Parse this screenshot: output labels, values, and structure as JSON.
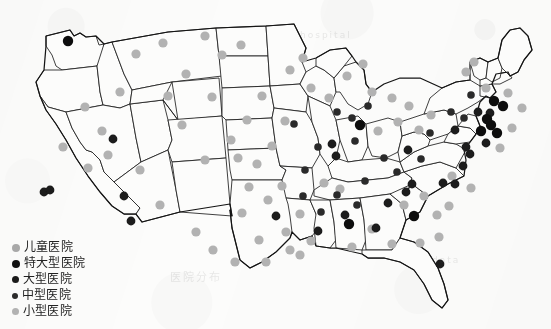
{
  "figure": {
    "kind": "choropleth-point-map",
    "region": "United States (contiguous)",
    "background_color": "#fcfcfb",
    "state_fill": "#fcfcfb",
    "state_stroke": "#1d1d1d"
  },
  "legend": {
    "position": "bottom-left",
    "items": [
      {
        "label": "儿童医院",
        "color": "#a8a8a8",
        "size": 8,
        "category": "childrens-hospital"
      },
      {
        "label": "特大型医院",
        "color": "#111111",
        "size": 8,
        "category": "extra-large-hospital"
      },
      {
        "label": "大型医院",
        "color": "#1a1a1a",
        "size": 7,
        "category": "large-hospital"
      },
      {
        "label": "中型医院",
        "color": "#2b2b2b",
        "size": 6,
        "category": "medium-hospital"
      },
      {
        "label": "小型医院",
        "color": "#b2b2b2",
        "size": 7,
        "category": "small-hospital"
      }
    ]
  },
  "ghost_marks": [
    {
      "text": "医院分布",
      "x": 170,
      "y": 268,
      "size": 11
    },
    {
      "text": "hospital",
      "x": 300,
      "y": 30,
      "size": 9
    },
    {
      "text": "data",
      "x": 432,
      "y": 255,
      "size": 9
    }
  ],
  "chart_data": {
    "type": "scatter",
    "title": "",
    "xlabel": "",
    "ylabel": "",
    "coordinate_space": "image-pixels",
    "categories": [
      "儿童医院",
      "特大型医院",
      "大型医院",
      "中型医院",
      "小型医院"
    ],
    "series": [
      {
        "name": "特大型医院",
        "color": "#111111",
        "r": 5.2,
        "points": [
          [
            68,
            41
          ],
          [
            494,
            101
          ],
          [
            503,
            106
          ],
          [
            487,
            119
          ],
          [
            491,
            125
          ],
          [
            481,
            131
          ],
          [
            497,
            133
          ],
          [
            360,
            125
          ],
          [
            414,
            216
          ],
          [
            349,
            224
          ]
        ]
      },
      {
        "name": "大型医院",
        "color": "#1a1a1a",
        "r": 4.4,
        "points": [
          [
            44,
            192
          ],
          [
            50,
            190
          ],
          [
            124,
            196
          ],
          [
            131,
            221
          ],
          [
            113,
            139
          ],
          [
            276,
            216
          ],
          [
            332,
            144
          ],
          [
            336,
            156
          ],
          [
            408,
            150
          ],
          [
            412,
            184
          ],
          [
            443,
            183
          ],
          [
            470,
            154
          ],
          [
            466,
            147
          ],
          [
            455,
            184
          ],
          [
            376,
            228
          ],
          [
            345,
            215
          ],
          [
            455,
            130
          ],
          [
            463,
            166
          ],
          [
            486,
            143
          ],
          [
            440,
            264
          ],
          [
            406,
            192
          ],
          [
            388,
            203
          ],
          [
            318,
            231
          ],
          [
            490,
            113
          ],
          [
            478,
            112
          ]
        ]
      },
      {
        "name": "中型医院",
        "color": "#2b2b2b",
        "r": 3.8,
        "points": [
          [
            355,
            141
          ],
          [
            318,
            147
          ],
          [
            305,
            170
          ],
          [
            365,
            181
          ],
          [
            384,
            158
          ],
          [
            421,
            159
          ],
          [
            430,
            133
          ],
          [
            451,
            112
          ],
          [
            471,
            95
          ],
          [
            464,
            118
          ],
          [
            337,
            195
          ],
          [
            303,
            196
          ],
          [
            357,
            205
          ],
          [
            321,
            212
          ],
          [
            397,
            172
          ],
          [
            352,
            118
          ],
          [
            368,
            106
          ],
          [
            337,
            112
          ],
          [
            294,
            124
          ]
        ]
      },
      {
        "name": "小型医院",
        "color": "#b2b2b2",
        "r": 4.6,
        "points": [
          [
            241,
            45
          ],
          [
            136,
            54
          ],
          [
            102,
            131
          ],
          [
            182,
            125
          ],
          [
            186,
            74
          ],
          [
            212,
            97
          ],
          [
            262,
            96
          ],
          [
            231,
            140
          ],
          [
            247,
            120
          ],
          [
            285,
            121
          ],
          [
            272,
            146
          ],
          [
            257,
            164
          ],
          [
            249,
            187
          ],
          [
            242,
            213
          ],
          [
            259,
            240
          ],
          [
            282,
            186
          ],
          [
            300,
            214
          ],
          [
            286,
            232
          ],
          [
            324,
            183
          ],
          [
            340,
            189
          ],
          [
            311,
            241
          ],
          [
            352,
            247
          ],
          [
            372,
            229
          ],
          [
            392,
            244
          ],
          [
            404,
            205
          ],
          [
            424,
            196
          ],
          [
            437,
            215
          ],
          [
            439,
            237
          ],
          [
            452,
            176
          ],
          [
            419,
            130
          ],
          [
            398,
            122
          ],
          [
            378,
            131
          ],
          [
            372,
            92
          ],
          [
            392,
            98
          ],
          [
            409,
            106
          ],
          [
            431,
            115
          ],
          [
            466,
            72
          ],
          [
            474,
            62
          ],
          [
            486,
            88
          ],
          [
            329,
            98
          ],
          [
            311,
            88
          ],
          [
            290,
            70
          ],
          [
            303,
            58
          ],
          [
            347,
            76
          ],
          [
            363,
            64
          ],
          [
            222,
            55
          ],
          [
            205,
            36
          ],
          [
            163,
            43
          ],
          [
            120,
            92
          ],
          [
            85,
            107
          ],
          [
            63,
            147
          ],
          [
            88,
            168
          ],
          [
            108,
            155
          ],
          [
            140,
            170
          ],
          [
            160,
            205
          ],
          [
            196,
            232
          ],
          [
            213,
            250
          ],
          [
            235,
            262
          ],
          [
            266,
            262
          ],
          [
            300,
            255
          ],
          [
            420,
            243
          ],
          [
            449,
            206
          ],
          [
            471,
            188
          ],
          [
            500,
            148
          ],
          [
            512,
            128
          ],
          [
            522,
            108
          ],
          [
            508,
            93
          ],
          [
            168,
            96
          ],
          [
            205,
            160
          ],
          [
            238,
            158
          ],
          [
            268,
            200
          ],
          [
            290,
            250
          ]
        ]
      }
    ]
  }
}
